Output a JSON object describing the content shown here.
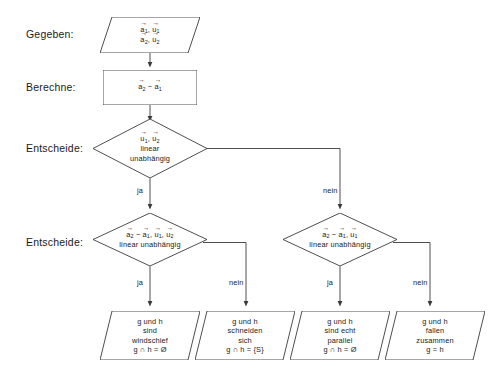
{
  "diagram": {
    "stroke_color": "#3a3a3a",
    "text_color": "#1a1a1a",
    "background": "#ffffff",
    "row_labels": [
      {
        "name": "gegeben",
        "text": "Gegeben:"
      },
      {
        "name": "berechne",
        "text": "Berechne:"
      },
      {
        "name": "entscheide-1",
        "text": "Entscheide:"
      },
      {
        "name": "entscheide-2",
        "text": "Entscheide:"
      }
    ],
    "input_node": {
      "shape": "parallelogram",
      "lines": [
        {
          "parts": [
            {
              "v": "a",
              "sub": "1"
            },
            {
              "sep": ", "
            },
            {
              "v": "u",
              "sub": "1"
            }
          ]
        },
        {
          "parts": [
            {
              "v": "a",
              "sub": "2"
            },
            {
              "sep": ", "
            },
            {
              "v": "u",
              "sub": "2"
            }
          ]
        }
      ]
    },
    "process_node": {
      "shape": "rectangle",
      "lines": [
        {
          "parts": [
            {
              "v": "a",
              "sub": "2"
            },
            {
              "sep": " − "
            },
            {
              "v": "a",
              "sub": "1"
            }
          ]
        }
      ]
    },
    "decision_1": {
      "shape": "diamond",
      "lines": [
        {
          "parts": [
            {
              "v": "u",
              "sub": "1"
            },
            {
              "sep": ", "
            },
            {
              "v": "u",
              "sub": "2"
            }
          ]
        },
        {
          "text": "linear"
        },
        {
          "text": "unabhängig"
        }
      ],
      "yes_label": "ja",
      "no_label": "nein"
    },
    "decision_2": {
      "shape": "diamond",
      "lines": [
        {
          "parts": [
            {
              "v": "a",
              "sub": "2"
            },
            {
              "sep": " − "
            },
            {
              "v": "a",
              "sub": "1"
            },
            {
              "sep": ", "
            },
            {
              "v": "u",
              "sub": "1"
            },
            {
              "sep": ", "
            },
            {
              "v": "u",
              "sub": "2"
            }
          ]
        },
        {
          "text": "linear unabhängig"
        }
      ],
      "yes_label": "ja",
      "no_label": "nein"
    },
    "decision_3": {
      "shape": "diamond",
      "lines": [
        {
          "parts": [
            {
              "v": "a",
              "sub": "2"
            },
            {
              "sep": " − "
            },
            {
              "v": "a",
              "sub": "1"
            },
            {
              "sep": ", "
            },
            {
              "v": "u",
              "sub": "1"
            }
          ]
        },
        {
          "text": "linear unabhängig"
        }
      ],
      "yes_label": "ja",
      "no_label": "nein"
    },
    "results": [
      {
        "name": "result-windschief",
        "shape": "parallelogram",
        "lines": [
          {
            "text": "g und h"
          },
          {
            "text": "sind"
          },
          {
            "text": "windschief"
          },
          {
            "text": "g ∩ h = Ø"
          }
        ]
      },
      {
        "name": "result-schneiden",
        "shape": "parallelogram",
        "lines": [
          {
            "text": "g und h"
          },
          {
            "text": "schneiden"
          },
          {
            "text": "sich"
          },
          {
            "text": "g ∩ h = {S}"
          }
        ]
      },
      {
        "name": "result-parallel",
        "shape": "parallelogram",
        "lines": [
          {
            "text": "g und h"
          },
          {
            "text": "sind echt"
          },
          {
            "text": "parallel"
          },
          {
            "text": "g ∩ h = Ø"
          }
        ]
      },
      {
        "name": "result-identisch",
        "shape": "parallelogram",
        "lines": [
          {
            "text": "g und h"
          },
          {
            "text": "fallen"
          },
          {
            "text": "zusammen"
          },
          {
            "text": "g = h"
          }
        ]
      }
    ]
  }
}
